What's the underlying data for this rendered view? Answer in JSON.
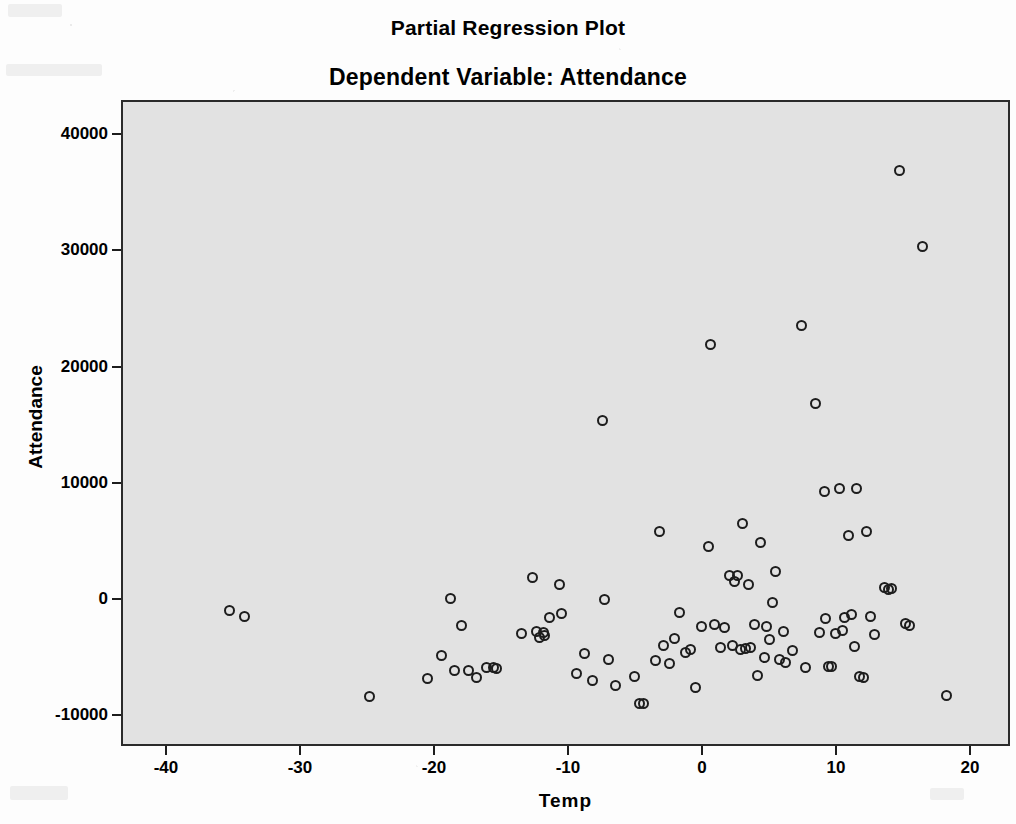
{
  "titles": {
    "main": "Partial Regression Plot",
    "sub": "Dependent Variable: Attendance"
  },
  "axes": {
    "x_title": "Temp",
    "y_title": "Attendance"
  },
  "chart_data": {
    "type": "scatter",
    "title": "Partial Regression Plot",
    "subtitle": "Dependent Variable: Attendance",
    "xlabel": "Temp",
    "ylabel": "Attendance",
    "xlim": [
      -43,
      23
    ],
    "ylim": [
      -12500,
      43000
    ],
    "xticks": [
      -40,
      -30,
      -20,
      -10,
      0,
      10,
      20
    ],
    "xticklabels": [
      "-40",
      "-30",
      "-20",
      "-10",
      "0",
      "10",
      "20"
    ],
    "yticks": [
      -10000,
      0,
      10000,
      20000,
      30000,
      40000
    ],
    "yticklabels": [
      "-10000",
      "0",
      "10000",
      "20000",
      "30000",
      "40000"
    ],
    "grid": false,
    "legend": null,
    "marker": "open-circle",
    "marker_color": "#1d1d1d",
    "plot_background": "#e2e2e2",
    "page_background": "#fdfdfd",
    "n_points": 96,
    "points": [
      [
        -35.4,
        -800
      ],
      [
        -34.3,
        -1300
      ],
      [
        -25.0,
        -8200
      ],
      [
        -20.6,
        -6700
      ],
      [
        -19.6,
        -4700
      ],
      [
        -18.9,
        200
      ],
      [
        -18.6,
        -6000
      ],
      [
        -18.1,
        -2100
      ],
      [
        -17.6,
        -6000
      ],
      [
        -17.0,
        -6600
      ],
      [
        -16.2,
        -5700
      ],
      [
        -15.7,
        -5700
      ],
      [
        -15.5,
        -5800
      ],
      [
        -12.8,
        2000
      ],
      [
        -12.5,
        -2600
      ],
      [
        -12.3,
        -3100
      ],
      [
        -12.0,
        -2700
      ],
      [
        -11.5,
        -1400
      ],
      [
        -10.8,
        1400
      ],
      [
        -10.6,
        -1100
      ],
      [
        -9.5,
        -6200
      ],
      [
        -8.9,
        -4500
      ],
      [
        -8.3,
        -6800
      ],
      [
        -7.6,
        15500
      ],
      [
        -7.4,
        100
      ],
      [
        -7.1,
        -5000
      ],
      [
        -6.6,
        -7300
      ],
      [
        -5.2,
        -6500
      ],
      [
        -4.8,
        -8800
      ],
      [
        -4.5,
        -8800
      ],
      [
        -3.6,
        -5100
      ],
      [
        -3.3,
        6000
      ],
      [
        -3.0,
        -3800
      ],
      [
        -2.6,
        -5400
      ],
      [
        -2.2,
        -3200
      ],
      [
        -1.8,
        -1000
      ],
      [
        -1.4,
        -4400
      ],
      [
        -1.0,
        -4200
      ],
      [
        -0.6,
        -7400
      ],
      [
        -0.2,
        -2200
      ],
      [
        0.3,
        4700
      ],
      [
        0.5,
        22100
      ],
      [
        0.8,
        -2000
      ],
      [
        1.2,
        -4000
      ],
      [
        1.5,
        -2300
      ],
      [
        1.9,
        2200
      ],
      [
        2.1,
        -3800
      ],
      [
        2.3,
        1700
      ],
      [
        2.5,
        2200
      ],
      [
        2.7,
        -4200
      ],
      [
        2.9,
        6700
      ],
      [
        3.1,
        -4100
      ],
      [
        3.3,
        1400
      ],
      [
        3.5,
        -4000
      ],
      [
        3.8,
        -2000
      ],
      [
        4.0,
        -6400
      ],
      [
        4.2,
        5000
      ],
      [
        4.5,
        -4900
      ],
      [
        4.7,
        -2200
      ],
      [
        4.9,
        -3300
      ],
      [
        5.1,
        -100
      ],
      [
        5.3,
        2500
      ],
      [
        5.6,
        -5000
      ],
      [
        6.1,
        -5300
      ],
      [
        7.3,
        23700
      ],
      [
        7.6,
        -5700
      ],
      [
        8.3,
        17000
      ],
      [
        8.6,
        -2700
      ],
      [
        9.0,
        9400
      ],
      [
        9.1,
        -1500
      ],
      [
        9.3,
        -5600
      ],
      [
        9.5,
        -5600
      ],
      [
        9.8,
        -2800
      ],
      [
        10.1,
        9700
      ],
      [
        10.3,
        -2500
      ],
      [
        10.5,
        -1400
      ],
      [
        10.8,
        5600
      ],
      [
        11.0,
        -1200
      ],
      [
        11.2,
        -3900
      ],
      [
        11.4,
        9700
      ],
      [
        11.6,
        -6500
      ],
      [
        11.9,
        -6600
      ],
      [
        12.1,
        6000
      ],
      [
        12.4,
        -1300
      ],
      [
        13.5,
        1200
      ],
      [
        13.8,
        1000
      ],
      [
        14.0,
        1100
      ],
      [
        14.6,
        37000
      ],
      [
        15.0,
        -1900
      ],
      [
        15.3,
        -2100
      ],
      [
        16.3,
        30500
      ],
      [
        18.1,
        -8100
      ],
      [
        -13.6,
        -2800
      ],
      [
        -11.9,
        -3000
      ],
      [
        6.6,
        -4300
      ],
      [
        5.9,
        -2600
      ],
      [
        12.7,
        -2900
      ]
    ]
  },
  "geometry": {
    "plot_left_px": 121,
    "plot_top_px": 100,
    "plot_width_px": 889,
    "plot_height_px": 646,
    "x_origin_px": 702,
    "x_scale_px_per_unit": 13.4,
    "y_origin_px": 599,
    "y_scale_px_per_unit": 0.011625
  }
}
